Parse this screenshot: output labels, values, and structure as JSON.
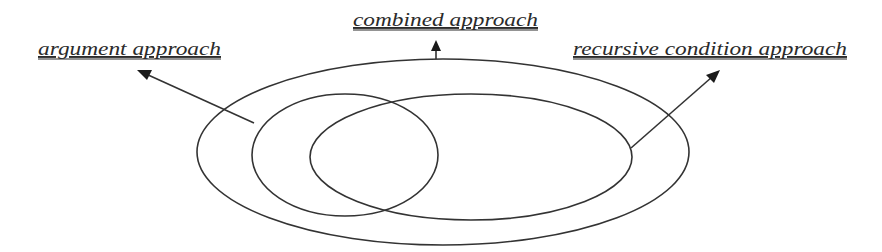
{
  "diagram": {
    "type": "nested-venn",
    "background": "#ffffff",
    "stroke_color": "#333333",
    "labels": {
      "argument": "argument approach",
      "combined": "combined approach",
      "recursive": "recursive condition approach"
    },
    "sets": [
      {
        "id": "combined",
        "label": "combined approach",
        "contains": [
          "argument",
          "recursive"
        ]
      },
      {
        "id": "argument",
        "label": "argument approach",
        "overlaps": [
          "recursive"
        ]
      },
      {
        "id": "recursive",
        "label": "recursive condition approach",
        "overlaps": [
          "argument"
        ]
      }
    ]
  }
}
